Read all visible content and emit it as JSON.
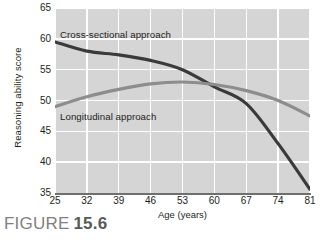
{
  "figure": {
    "caption_word": "FIGURE",
    "caption_number": "15.6"
  },
  "chart_data": {
    "type": "line",
    "title": "",
    "xlabel": "Age (years)",
    "ylabel": "Reasoning ability score",
    "x": [
      25,
      32,
      39,
      46,
      53,
      60,
      67,
      74,
      81
    ],
    "xlim": [
      25,
      81
    ],
    "ylim": [
      35,
      65
    ],
    "yticks": [
      65,
      60,
      55,
      50,
      45,
      40,
      35
    ],
    "xticks": [
      25,
      32,
      39,
      46,
      53,
      60,
      67,
      74,
      81
    ],
    "grid": true,
    "legend_position": "inline-annotations",
    "plot_background": "#d5d5d5",
    "gridline_color": "#ffffff",
    "series": [
      {
        "name": "Cross-sectional approach",
        "color": "#3a3a3a",
        "values": [
          59.5,
          58.0,
          57.4,
          56.5,
          55.0,
          52.2,
          49.5,
          43.0,
          35.6
        ],
        "label_x": 25,
        "label_y": 61.5
      },
      {
        "name": "Longitudinal approach",
        "color": "#8d8d8d",
        "values": [
          49.0,
          50.6,
          51.8,
          52.7,
          53.0,
          52.6,
          51.6,
          50.0,
          47.5
        ],
        "label_x": 25,
        "label_y": 47.8
      }
    ],
    "annotations": [
      {
        "text": "Cross-sectional approach",
        "series": "Cross-sectional approach"
      },
      {
        "text": "Longitudinal approach",
        "series": "Longitudinal approach"
      }
    ]
  }
}
